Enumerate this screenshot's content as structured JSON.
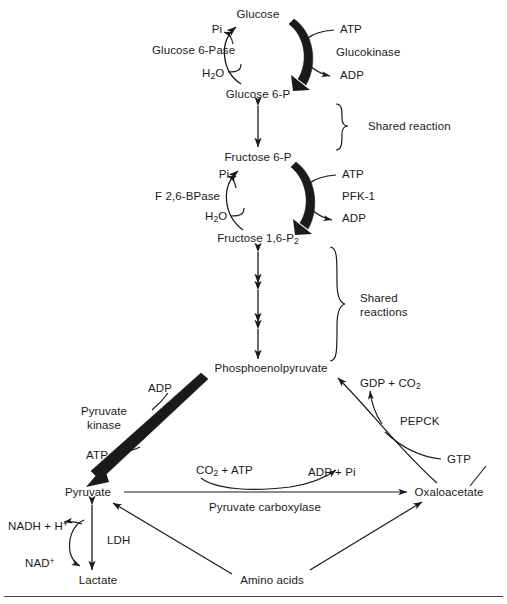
{
  "diagram": {
    "type": "biochemical-pathway",
    "colors": {
      "stroke": "#1a1a1a",
      "background": "#ffffff",
      "rule": "#444444"
    },
    "metabolites": [
      {
        "id": "glucose",
        "label": "Glucose",
        "x": 258,
        "y": 14
      },
      {
        "id": "glucose6p",
        "label": "Glucose 6-P",
        "x": 258,
        "y": 94
      },
      {
        "id": "fructose6p",
        "label": "Fructose 6-P",
        "x": 258,
        "y": 157
      },
      {
        "id": "fbp",
        "label": "Fructose 1,6-P",
        "sub": "2",
        "x": 258,
        "y": 240
      },
      {
        "id": "pep",
        "label": "Phosphoenolpyruvate",
        "x": 271,
        "y": 368
      },
      {
        "id": "pyruvate",
        "label": "Pyruvate",
        "x": 88,
        "y": 492
      },
      {
        "id": "oxaloacetate",
        "label": "Oxaloacetate",
        "x": 449,
        "y": 492
      },
      {
        "id": "lactate",
        "label": "Lactate",
        "x": 98,
        "y": 580
      },
      {
        "id": "aminoacids",
        "label": "Amino acids",
        "x": 272,
        "y": 580
      }
    ],
    "enzymes": [
      {
        "id": "glucose6pase",
        "label": "Glucose 6-Pase",
        "x": 152,
        "y": 50,
        "align": "left"
      },
      {
        "id": "glucokinase",
        "label": "Glucokinase",
        "x": 336,
        "y": 52,
        "align": "left"
      },
      {
        "id": "f26bpase",
        "label": "F 2,6-BPase",
        "x": 155,
        "y": 196,
        "align": "left"
      },
      {
        "id": "pfk1",
        "label": "PFK-1",
        "x": 342,
        "y": 196,
        "align": "left"
      },
      {
        "id": "pyruvatekinase",
        "label": "Pyruvate\nkinase",
        "x": 104,
        "y": 418,
        "align": "center"
      },
      {
        "id": "pepck",
        "label": "PEPCK",
        "x": 400,
        "y": 421,
        "align": "left"
      },
      {
        "id": "pyruvatecarboxylase",
        "label": "Pyruvate carboxylase",
        "x": 265,
        "y": 507,
        "align": "center"
      },
      {
        "id": "ldh",
        "label": "LDH",
        "x": 107,
        "y": 540,
        "align": "left"
      }
    ],
    "cofactors": [
      {
        "id": "pi-top",
        "label": "Pi",
        "x": 217,
        "y": 29,
        "align": "center"
      },
      {
        "id": "atp-top",
        "label": "ATP",
        "x": 340,
        "y": 29,
        "align": "left"
      },
      {
        "id": "h2o-top",
        "label": "H",
        "sub": "2",
        "suffix": "O",
        "x": 202,
        "y": 75,
        "align": "left"
      },
      {
        "id": "adp-top",
        "label": "ADP",
        "x": 340,
        "y": 75,
        "align": "left"
      },
      {
        "id": "pi-mid",
        "label": "Pi",
        "x": 224,
        "y": 174,
        "align": "center"
      },
      {
        "id": "atp-mid",
        "label": "ATP",
        "x": 342,
        "y": 174,
        "align": "left"
      },
      {
        "id": "h2o-mid",
        "label": "H",
        "sub": "2",
        "suffix": "O",
        "x": 205,
        "y": 218,
        "align": "left"
      },
      {
        "id": "adp-mid",
        "label": "ADP",
        "x": 342,
        "y": 218,
        "align": "left"
      },
      {
        "id": "adp-pk",
        "label": "ADP",
        "x": 172,
        "y": 388,
        "align": "right"
      },
      {
        "id": "atp-pk",
        "label": "ATP",
        "x": 97,
        "y": 455,
        "align": "center"
      },
      {
        "id": "gdp-co2",
        "label": "GDP + CO",
        "sub": "2",
        "x": 360,
        "y": 385,
        "align": "left"
      },
      {
        "id": "gtp",
        "label": "GTP",
        "x": 447,
        "y": 459,
        "align": "left"
      },
      {
        "id": "co2-atp",
        "label": "CO",
        "sub": "2",
        "suffix": " + ATP",
        "x": 196,
        "y": 472,
        "align": "left"
      },
      {
        "id": "adp-pi",
        "label": "ADP + Pi",
        "x": 308,
        "y": 472,
        "align": "left"
      },
      {
        "id": "nadh-h",
        "label": "NADH + H",
        "sup": "+",
        "x": 8,
        "y": 525,
        "align": "left"
      },
      {
        "id": "nad-plus",
        "label": "NAD",
        "sup": "+",
        "x": 25,
        "y": 562,
        "align": "left"
      }
    ],
    "brackets": [
      {
        "id": "shared-reaction",
        "label": "Shared reaction",
        "x": 368,
        "y": 126,
        "top": 104,
        "bottom": 150
      },
      {
        "id": "shared-reactions",
        "label": "Shared\nreactions",
        "x": 360,
        "y": 305,
        "top": 247,
        "bottom": 361
      }
    ]
  }
}
